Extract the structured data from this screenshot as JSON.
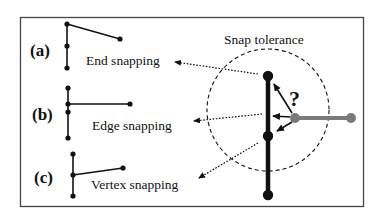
{
  "diagram": {
    "title_label": "Snap tolerance",
    "panels": [
      {
        "id": "a",
        "tag": "(a)",
        "caption": "End snapping"
      },
      {
        "id": "b",
        "tag": "(b)",
        "caption": "Edge snapping"
      },
      {
        "id": "c",
        "tag": "(c)",
        "caption": "Vertex snapping"
      }
    ],
    "question_mark": "?",
    "colors": {
      "ink": "#111111",
      "grey_segment": "#7a7a7a",
      "frame": "#444444",
      "background": "#ffffff"
    }
  }
}
